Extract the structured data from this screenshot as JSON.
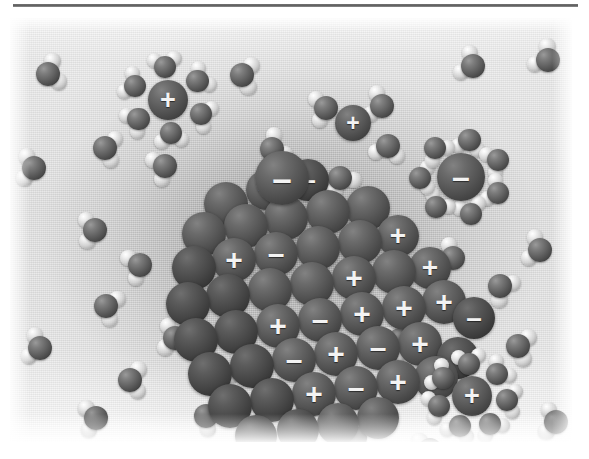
{
  "figure": {
    "medium": "grayscale rendered illustration",
    "charge_positive": "+",
    "charge_negative": "–",
    "colors": {
      "oxygen": "#5e5e5e",
      "hydrogen": "#d2d2d2",
      "ion": "#5c5c5c",
      "ion_dark": "#474747",
      "background_light": "#eeeeee",
      "background_mid": "#b9b9b9",
      "rule": "#5a5a5a",
      "charge_glyph": "#f3f3f3"
    }
  },
  "rule": {
    "label": "horizontal-rule"
  },
  "crystal": {
    "label": "ionic-crystal-lattice",
    "origin": {
      "x": 168,
      "y": 150
    },
    "ions": [
      {
        "cx": 48,
        "cy": 36,
        "r": 22,
        "shade": "mid",
        "charge": ""
      },
      {
        "cx": 88,
        "cy": 22,
        "r": 20,
        "shade": "mid",
        "charge": "+"
      },
      {
        "cx": 130,
        "cy": 12,
        "r": 21,
        "shade": "dark",
        "charge": "–"
      },
      {
        "cx": 26,
        "cy": 66,
        "r": 22,
        "shade": "mid",
        "charge": ""
      },
      {
        "cx": 68,
        "cy": 58,
        "r": 22,
        "shade": "mid",
        "charge": ""
      },
      {
        "cx": 108,
        "cy": 50,
        "r": 22,
        "shade": "mid",
        "charge": ""
      },
      {
        "cx": 150,
        "cy": 44,
        "r": 22,
        "shade": "mid",
        "charge": ""
      },
      {
        "cx": 190,
        "cy": 40,
        "r": 22,
        "shade": "mid",
        "charge": ""
      },
      {
        "cx": 16,
        "cy": 100,
        "r": 22,
        "shade": "dark",
        "charge": ""
      },
      {
        "cx": 56,
        "cy": 92,
        "r": 22,
        "shade": "mid",
        "charge": "+"
      },
      {
        "cx": 98,
        "cy": 86,
        "r": 22,
        "shade": "mid",
        "charge": "–"
      },
      {
        "cx": 140,
        "cy": 80,
        "r": 22,
        "shade": "mid",
        "charge": ""
      },
      {
        "cx": 182,
        "cy": 74,
        "r": 22,
        "shade": "mid",
        "charge": ""
      },
      {
        "cx": 220,
        "cy": 68,
        "r": 21,
        "shade": "mid",
        "charge": "+"
      },
      {
        "cx": 10,
        "cy": 136,
        "r": 22,
        "shade": "dark",
        "charge": ""
      },
      {
        "cx": 50,
        "cy": 128,
        "r": 22,
        "shade": "dark",
        "charge": ""
      },
      {
        "cx": 92,
        "cy": 122,
        "r": 22,
        "shade": "mid",
        "charge": ""
      },
      {
        "cx": 134,
        "cy": 116,
        "r": 22,
        "shade": "mid",
        "charge": ""
      },
      {
        "cx": 176,
        "cy": 110,
        "r": 22,
        "shade": "mid",
        "charge": "+"
      },
      {
        "cx": 216,
        "cy": 104,
        "r": 22,
        "shade": "mid",
        "charge": ""
      },
      {
        "cx": 252,
        "cy": 100,
        "r": 21,
        "shade": "mid",
        "charge": "+"
      },
      {
        "cx": 18,
        "cy": 172,
        "r": 22,
        "shade": "dark",
        "charge": ""
      },
      {
        "cx": 58,
        "cy": 164,
        "r": 22,
        "shade": "dark",
        "charge": ""
      },
      {
        "cx": 100,
        "cy": 158,
        "r": 22,
        "shade": "mid",
        "charge": "+"
      },
      {
        "cx": 142,
        "cy": 152,
        "r": 22,
        "shade": "mid",
        "charge": "–"
      },
      {
        "cx": 184,
        "cy": 146,
        "r": 22,
        "shade": "mid",
        "charge": "+"
      },
      {
        "cx": 226,
        "cy": 140,
        "r": 22,
        "shade": "mid",
        "charge": "+"
      },
      {
        "cx": 266,
        "cy": 134,
        "r": 22,
        "shade": "mid",
        "charge": "+"
      },
      {
        "cx": 296,
        "cy": 150,
        "r": 21,
        "shade": "dark",
        "charge": "–"
      },
      {
        "cx": 32,
        "cy": 206,
        "r": 22,
        "shade": "dark",
        "charge": ""
      },
      {
        "cx": 74,
        "cy": 198,
        "r": 22,
        "shade": "dark",
        "charge": ""
      },
      {
        "cx": 116,
        "cy": 192,
        "r": 22,
        "shade": "mid",
        "charge": "–"
      },
      {
        "cx": 158,
        "cy": 186,
        "r": 22,
        "shade": "mid",
        "charge": "+"
      },
      {
        "cx": 200,
        "cy": 180,
        "r": 22,
        "shade": "mid",
        "charge": "–"
      },
      {
        "cx": 242,
        "cy": 176,
        "r": 22,
        "shade": "mid",
        "charge": "+"
      },
      {
        "cx": 280,
        "cy": 190,
        "r": 21,
        "shade": "dark",
        "charge": ""
      },
      {
        "cx": 52,
        "cy": 238,
        "r": 22,
        "shade": "dark",
        "charge": ""
      },
      {
        "cx": 94,
        "cy": 232,
        "r": 22,
        "shade": "dark",
        "charge": ""
      },
      {
        "cx": 136,
        "cy": 226,
        "r": 22,
        "shade": "mid",
        "charge": "+"
      },
      {
        "cx": 178,
        "cy": 220,
        "r": 22,
        "shade": "mid",
        "charge": "–"
      },
      {
        "cx": 220,
        "cy": 214,
        "r": 22,
        "shade": "mid",
        "charge": "+"
      },
      {
        "cx": 258,
        "cy": 210,
        "r": 22,
        "shade": "mid",
        "charge": "–"
      },
      {
        "cx": 78,
        "cy": 268,
        "r": 21,
        "shade": "dark",
        "charge": ""
      },
      {
        "cx": 120,
        "cy": 262,
        "r": 21,
        "shade": "dark",
        "charge": ""
      },
      {
        "cx": 160,
        "cy": 256,
        "r": 21,
        "shade": "mid",
        "charge": ""
      },
      {
        "cx": 200,
        "cy": 250,
        "r": 21,
        "shade": "mid",
        "charge": ""
      }
    ]
  },
  "free_ions": [
    {
      "label": "detaching-anion",
      "cx": 272,
      "cy": 160,
      "r": 27,
      "charge": "–"
    },
    {
      "label": "free-cation-top",
      "cx": 343,
      "cy": 105,
      "r": 18,
      "charge": "+"
    }
  ],
  "hydrated_clusters": [
    {
      "label": "hydrated-cation-upper-left",
      "cx": 158,
      "cy": 82,
      "ion_r": 20,
      "shell_r": 36,
      "charge": "+",
      "n_water": 6
    },
    {
      "label": "hydrated-anion-upper-right",
      "cx": 451,
      "cy": 159,
      "ion_r": 24,
      "shell_r": 41,
      "charge": "–",
      "n_water": 7
    },
    {
      "label": "hydrated-cation-lower-right",
      "cx": 462,
      "cy": 378,
      "ion_r": 20,
      "shell_r": 35,
      "charge": "+",
      "n_water": 7
    }
  ],
  "water_molecules": [
    {
      "cx": 38,
      "cy": 56,
      "rot": -18
    },
    {
      "cx": 95,
      "cy": 130,
      "rot": 12
    },
    {
      "cx": 155,
      "cy": 148,
      "rot": 155
    },
    {
      "cx": 232,
      "cy": 57,
      "rot": 8
    },
    {
      "cx": 262,
      "cy": 131,
      "rot": -30
    },
    {
      "cx": 316,
      "cy": 90,
      "rot": 170
    },
    {
      "cx": 372,
      "cy": 88,
      "rot": 195
    },
    {
      "cx": 378,
      "cy": 128,
      "rot": 100
    },
    {
      "cx": 330,
      "cy": 160,
      "rot": 60
    },
    {
      "cx": 463,
      "cy": 48,
      "rot": 205
    },
    {
      "cx": 538,
      "cy": 42,
      "rot": 215
    },
    {
      "cx": 85,
      "cy": 212,
      "rot": 176
    },
    {
      "cx": 130,
      "cy": 247,
      "rot": 160
    },
    {
      "cx": 96,
      "cy": 288,
      "rot": 20
    },
    {
      "cx": 165,
      "cy": 320,
      "rot": 188
    },
    {
      "cx": 120,
      "cy": 362,
      "rot": 2
    },
    {
      "cx": 86,
      "cy": 400,
      "rot": 172
    },
    {
      "cx": 196,
      "cy": 398,
      "rot": 28
    },
    {
      "cx": 232,
      "cy": 352,
      "rot": 205
    },
    {
      "cx": 298,
      "cy": 388,
      "rot": 185
    },
    {
      "cx": 390,
      "cy": 322,
      "rot": 150
    },
    {
      "cx": 345,
      "cy": 420,
      "rot": 10
    },
    {
      "cx": 443,
      "cy": 240,
      "rot": 200
    },
    {
      "cx": 490,
      "cy": 268,
      "rot": 40
    },
    {
      "cx": 530,
      "cy": 232,
      "rot": 195
    },
    {
      "cx": 508,
      "cy": 328,
      "rot": 14
    },
    {
      "cx": 546,
      "cy": 404,
      "rot": 188
    },
    {
      "cx": 420,
      "cy": 432,
      "rot": 168
    },
    {
      "cx": 24,
      "cy": 150,
      "rot": 186
    },
    {
      "cx": 30,
      "cy": 330,
      "rot": 196
    }
  ]
}
